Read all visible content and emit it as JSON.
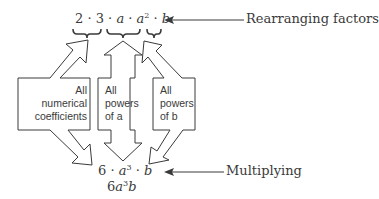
{
  "top_expression": {
    "parts": [
      "2",
      "3",
      "a",
      "a",
      "2",
      "b"
    ],
    "display": "2 · 3 · a · a² · b"
  },
  "labels": {
    "rearranging": "Rearranging factors",
    "multiplying": "Multiplying"
  },
  "boxes": [
    {
      "lines": [
        "All",
        "numerical",
        "coefficients"
      ]
    },
    {
      "lines": [
        "All",
        "powers",
        "of a"
      ]
    },
    {
      "lines": [
        "All",
        "powers",
        "of b"
      ]
    }
  ],
  "bottom_expression": {
    "line1": {
      "coef": "6",
      "var1": "a",
      "exp1": "3",
      "var2": "b"
    },
    "line2": {
      "coef": "6",
      "var1": "a",
      "exp1": "3",
      "var2": "b"
    }
  },
  "colors": {
    "ink": "#3a3a3a",
    "background": "#ffffff"
  }
}
